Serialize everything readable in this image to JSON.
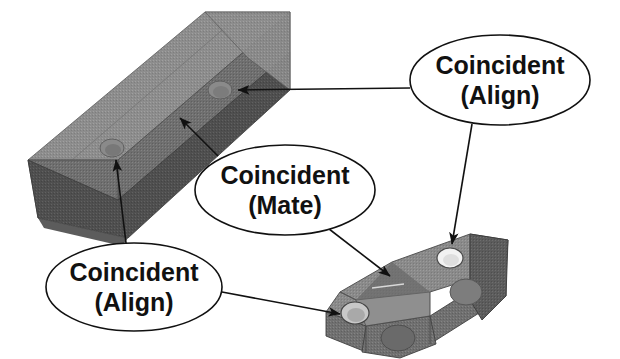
{
  "diagram": {
    "background_color": "#ffffff",
    "line_color": "#111111",
    "parts": [
      {
        "name": "beam",
        "description": "long diagonal extruded beam with two through holes",
        "faces": {
          "top_color": "#8d8d8d",
          "front_color": "#6f6f6f",
          "bottom_color": "#4f4f4f",
          "end_color": "#7b7b7b"
        },
        "holes": 2
      },
      {
        "name": "bracket",
        "description": "T-shaped mounting bracket with two holes",
        "faces": {
          "top_color": "#8a8a8a",
          "front_color": "#707070",
          "side_color": "#5c5c5c"
        },
        "holes": 2
      }
    ],
    "callouts": [
      {
        "id": "align-top-right",
        "line1": "Coincident",
        "line2": "(Align)",
        "cx": 500,
        "cy": 80,
        "rx": 90,
        "ry": 45
      },
      {
        "id": "mate-middle",
        "line1": "Coincident",
        "line2": "(Mate)",
        "cx": 285,
        "cy": 190,
        "rx": 90,
        "ry": 45
      },
      {
        "id": "align-bottom-left",
        "line1": "Coincident",
        "line2": "(Align)",
        "cx": 134,
        "cy": 287,
        "rx": 88,
        "ry": 44
      }
    ]
  }
}
